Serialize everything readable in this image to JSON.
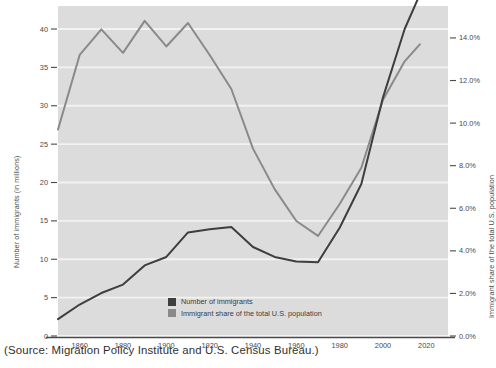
{
  "caption": "(Source: Migration Policy Institute and U.S. Census Bureau.)",
  "colors": {
    "plot_background": "#dcdcdc",
    "grid": "#f2f2f2",
    "immigrants_line": "#3e3e3e",
    "share_line": "#8a8a8a",
    "axis": "#4a4a4a",
    "text": "#4a4a4a"
  },
  "legend": {
    "position": "inside-bottom-center",
    "items": [
      {
        "label": "Number of immigrants",
        "color": "#3e3e3e",
        "swatch": "legend-swatch-immigrants"
      },
      {
        "label": "Immigrant share of the total U.S. population",
        "color": "#8a8a8a",
        "swatch": "legend-swatch-share"
      }
    ]
  },
  "chart_data": {
    "type": "line",
    "title": "",
    "subtitle": "",
    "xlabel": "",
    "ylabel": "Number of immigrants (in millions)",
    "y2label": "Immigrant share of the total U.S. population",
    "grid": true,
    "xlim": [
      1850,
      2030
    ],
    "ylim": [
      0,
      43
    ],
    "y2lim": [
      0,
      15.5
    ],
    "xticks": [
      1860,
      1880,
      1900,
      1920,
      1940,
      1960,
      1980,
      2000,
      2020
    ],
    "xticklabels": [
      "1860",
      "1880",
      "1900",
      "1920",
      "1940",
      "1960",
      "1980",
      "2000",
      "2020"
    ],
    "yticks": [
      0,
      5,
      10,
      15,
      20,
      25,
      30,
      35,
      40
    ],
    "yticklabels": [
      "0",
      "5",
      "10",
      "15",
      "20",
      "25",
      "30",
      "35",
      "40"
    ],
    "y2ticks": [
      0.0,
      2.0,
      4.0,
      6.0,
      8.0,
      10.0,
      12.0,
      14.0
    ],
    "y2ticklabels": [
      "0.0%",
      "2.0%",
      "4.0%",
      "6.0%",
      "8.0%",
      "10.0%",
      "12.0%",
      "14.0%"
    ],
    "x": [
      1850,
      1860,
      1870,
      1880,
      1890,
      1900,
      1910,
      1920,
      1930,
      1940,
      1950,
      1960,
      1970,
      1980,
      1990,
      2000,
      2010,
      2017
    ],
    "series": [
      {
        "name": "Number of immigrants",
        "axis": "left",
        "color": "#3e3e3e",
        "units": "millions",
        "values": [
          2.2,
          4.1,
          5.6,
          6.7,
          9.2,
          10.3,
          13.5,
          13.9,
          14.2,
          11.6,
          10.3,
          9.7,
          9.6,
          14.1,
          19.8,
          31.1,
          40.0,
          44.5
        ]
      },
      {
        "name": "Immigrant share of the total U.S. population",
        "axis": "right",
        "color": "#8a8a8a",
        "units": "percent",
        "values": [
          9.7,
          13.2,
          14.4,
          13.3,
          14.8,
          13.6,
          14.7,
          13.2,
          11.6,
          8.8,
          6.9,
          5.4,
          4.7,
          6.2,
          7.9,
          11.1,
          12.9,
          13.7
        ]
      }
    ]
  }
}
